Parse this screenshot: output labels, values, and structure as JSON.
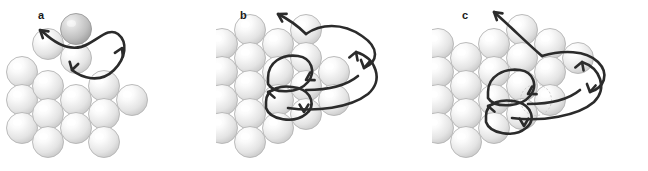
{
  "figure": {
    "width": 648,
    "height": 171,
    "background_color": "#ffffff",
    "caption_labels": [
      "a",
      "b",
      "c"
    ]
  },
  "style": {
    "sphere_fill_light": "#fbfbfb",
    "sphere_fill_mid": "#e4e4e4",
    "sphere_fill_edge": "#c9c9c9",
    "sphere_stroke": "#b4b4b4",
    "sphere_highlight": "#ffffff",
    "adatom_fill_light": "#e0e0e0",
    "adatom_fill_mid": "#bfbfbf",
    "adatom_fill_edge": "#9e9e9e",
    "adatom_stroke": "#9a9a9a",
    "arrow_color": "#2b2b2b",
    "arrow_width": 2.6,
    "label_color": "#1a1a1a",
    "sphere_radius": 15.5
  },
  "panels": [
    {
      "id": "a",
      "label": "a",
      "label_x": 38,
      "label_y": 10,
      "description": "Adatom hop across surface with exchange loop",
      "lattice_atoms": [
        {
          "cx": 22,
          "cy": 72,
          "r": 15.5,
          "type": "substrate"
        },
        {
          "cx": 22,
          "cy": 100,
          "r": 15.5,
          "type": "substrate"
        },
        {
          "cx": 22,
          "cy": 128,
          "r": 15.5,
          "type": "substrate"
        },
        {
          "cx": 48,
          "cy": 44,
          "r": 15.5,
          "type": "substrate"
        },
        {
          "cx": 48,
          "cy": 86,
          "r": 15.5,
          "type": "substrate"
        },
        {
          "cx": 48,
          "cy": 114,
          "r": 15.5,
          "type": "substrate"
        },
        {
          "cx": 48,
          "cy": 142,
          "r": 15.5,
          "type": "substrate"
        },
        {
          "cx": 76,
          "cy": 58,
          "r": 15.5,
          "type": "substrate"
        },
        {
          "cx": 76,
          "cy": 100,
          "r": 15.5,
          "type": "substrate"
        },
        {
          "cx": 76,
          "cy": 128,
          "r": 15.5,
          "type": "substrate"
        },
        {
          "cx": 104,
          "cy": 86,
          "r": 15.5,
          "type": "substrate"
        },
        {
          "cx": 104,
          "cy": 114,
          "r": 15.5,
          "type": "substrate"
        },
        {
          "cx": 104,
          "cy": 142,
          "r": 15.5,
          "type": "substrate"
        },
        {
          "cx": 132,
          "cy": 100,
          "r": 15.5,
          "type": "substrate"
        }
      ],
      "adatoms": [
        {
          "cx": 76,
          "cy": 29,
          "r": 15.5,
          "type": "adatom"
        }
      ],
      "arrows": [
        {
          "name": "exchange-loop-path",
          "d": "M 43 32 C 58 46, 74 52, 88 44 C 102 36, 110 28, 118 34 C 128 42, 126 58, 114 70 C 100 84, 82 78, 72 70"
        },
        {
          "name": "hop-arrow-up-left",
          "d": "M 43 32 L 40 30"
        }
      ],
      "arrowheads": [
        {
          "name": "arrowhead-up-left",
          "x": 40,
          "y": 30,
          "angle": -140
        },
        {
          "name": "arrowhead-down",
          "x": 72,
          "y": 70,
          "angle": 105
        },
        {
          "name": "arrowhead-right-up",
          "x": 122,
          "y": 48,
          "angle": -65
        }
      ]
    },
    {
      "id": "b",
      "label": "b",
      "label_x": 24,
      "label_y": 10,
      "description": "Adatom detachment from step edge with multiple exchange pathways",
      "lattice_atoms": [
        {
          "cx": 6,
          "cy": 44,
          "r": 15.5,
          "type": "substrate"
        },
        {
          "cx": 6,
          "cy": 72,
          "r": 15.5,
          "type": "substrate"
        },
        {
          "cx": 6,
          "cy": 100,
          "r": 15.5,
          "type": "substrate"
        },
        {
          "cx": 6,
          "cy": 128,
          "r": 15.5,
          "type": "substrate"
        },
        {
          "cx": 34,
          "cy": 30,
          "r": 15.5,
          "type": "substrate"
        },
        {
          "cx": 34,
          "cy": 58,
          "r": 15.5,
          "type": "substrate"
        },
        {
          "cx": 34,
          "cy": 86,
          "r": 15.5,
          "type": "substrate"
        },
        {
          "cx": 34,
          "cy": 114,
          "r": 15.5,
          "type": "substrate"
        },
        {
          "cx": 34,
          "cy": 142,
          "r": 15.5,
          "type": "substrate"
        },
        {
          "cx": 62,
          "cy": 44,
          "r": 15.5,
          "type": "substrate"
        },
        {
          "cx": 62,
          "cy": 72,
          "r": 15.5,
          "type": "substrate"
        },
        {
          "cx": 62,
          "cy": 100,
          "r": 15.5,
          "type": "substrate"
        },
        {
          "cx": 62,
          "cy": 128,
          "r": 15.5,
          "type": "substrate"
        },
        {
          "cx": 90,
          "cy": 30,
          "r": 15.5,
          "type": "substrate"
        },
        {
          "cx": 90,
          "cy": 58,
          "r": 15.5,
          "type": "substrate"
        },
        {
          "cx": 90,
          "cy": 86,
          "r": 15.5,
          "type": "substrate"
        },
        {
          "cx": 90,
          "cy": 114,
          "r": 15.5,
          "type": "substrate"
        },
        {
          "cx": 118,
          "cy": 72,
          "r": 15.5,
          "type": "substrate"
        },
        {
          "cx": 118,
          "cy": 100,
          "r": 15.5,
          "type": "substrate"
        }
      ],
      "adatoms": [],
      "arrows": [
        {
          "name": "detach-arrow-up-left",
          "d": "M 90 34 C 82 26, 74 20, 62 14"
        },
        {
          "name": "long-exchange-arc-upper",
          "d": "M 90 34 C 104 24, 126 22, 146 36 C 164 48, 162 62, 148 68"
        },
        {
          "name": "long-exchange-arc-lower",
          "d": "M 72 108 C 100 112, 134 108, 152 94 C 168 80, 160 58, 140 52"
        },
        {
          "name": "exchange-loop-upper",
          "d": "M 52 78 C 52 62, 66 54, 82 56 C 96 58, 100 72, 92 82 C 82 94, 58 94, 52 84 Z"
        },
        {
          "name": "exchange-loop-lower",
          "d": "M 50 102 C 50 88, 66 84, 82 88 C 96 92, 100 106, 90 114 C 78 124, 54 120, 50 108 Z"
        },
        {
          "name": "mid-return-arc",
          "d": "M 90 90 C 110 90, 130 86, 142 76"
        }
      ],
      "arrowheads": [
        {
          "name": "arrowhead-detach-up-left",
          "x": 62,
          "y": 14,
          "angle": -150
        },
        {
          "name": "arrowhead-upper-arc-in",
          "x": 148,
          "y": 68,
          "angle": 100
        },
        {
          "name": "arrowhead-lower-arc-in",
          "x": 140,
          "y": 52,
          "angle": -70
        },
        {
          "name": "arrowhead-loop-upper",
          "x": 90,
          "y": 80,
          "angle": 150
        },
        {
          "name": "arrowhead-loop-lower",
          "x": 88,
          "y": 112,
          "angle": 90
        },
        {
          "name": "arrowhead-loop-left",
          "x": 52,
          "y": 92,
          "angle": 190
        }
      ]
    },
    {
      "id": "c",
      "label": "c",
      "label_x": 30,
      "label_y": 10,
      "description": "Adatom ascent over step edge with exchange loops at the terrace",
      "lattice_atoms": [
        {
          "cx": 6,
          "cy": 44,
          "r": 15.5,
          "type": "substrate"
        },
        {
          "cx": 6,
          "cy": 72,
          "r": 15.5,
          "type": "substrate"
        },
        {
          "cx": 6,
          "cy": 100,
          "r": 15.5,
          "type": "substrate"
        },
        {
          "cx": 6,
          "cy": 128,
          "r": 15.5,
          "type": "substrate"
        },
        {
          "cx": 34,
          "cy": 58,
          "r": 15.5,
          "type": "substrate"
        },
        {
          "cx": 34,
          "cy": 86,
          "r": 15.5,
          "type": "substrate"
        },
        {
          "cx": 34,
          "cy": 114,
          "r": 15.5,
          "type": "substrate"
        },
        {
          "cx": 34,
          "cy": 142,
          "r": 15.5,
          "type": "substrate"
        },
        {
          "cx": 62,
          "cy": 44,
          "r": 15.5,
          "type": "substrate"
        },
        {
          "cx": 62,
          "cy": 72,
          "r": 15.5,
          "type": "substrate"
        },
        {
          "cx": 62,
          "cy": 100,
          "r": 15.5,
          "type": "substrate"
        },
        {
          "cx": 62,
          "cy": 128,
          "r": 15.5,
          "type": "substrate"
        },
        {
          "cx": 90,
          "cy": 30,
          "r": 15.5,
          "type": "substrate"
        },
        {
          "cx": 90,
          "cy": 58,
          "r": 15.5,
          "type": "substrate"
        },
        {
          "cx": 90,
          "cy": 86,
          "r": 15.5,
          "type": "substrate"
        },
        {
          "cx": 90,
          "cy": 114,
          "r": 15.5,
          "type": "substrate"
        },
        {
          "cx": 118,
          "cy": 44,
          "r": 15.5,
          "type": "substrate"
        },
        {
          "cx": 118,
          "cy": 72,
          "r": 15.5,
          "type": "substrate"
        },
        {
          "cx": 118,
          "cy": 100,
          "r": 15.5,
          "type": "substrate"
        },
        {
          "cx": 146,
          "cy": 58,
          "r": 15.5,
          "type": "substrate"
        }
      ],
      "adatoms": [],
      "adatom_ghosts": [
        {
          "cx": 104,
          "cy": 100,
          "r": 15.5
        }
      ],
      "arrows": [
        {
          "name": "ascent-arrow-up-left",
          "d": "M 110 56 C 96 44, 80 28, 62 12"
        },
        {
          "name": "long-exchange-arc-upper",
          "d": "M 110 56 C 130 50, 154 50, 166 62 C 178 74, 172 88, 158 92"
        },
        {
          "name": "long-exchange-arc-lower",
          "d": "M 80 118 C 110 122, 146 116, 162 102 C 176 88, 168 68, 150 62"
        },
        {
          "name": "exchange-loop-upper",
          "d": "M 56 92 C 56 76, 72 68, 88 70 C 102 72, 106 86, 98 96 C 88 108, 62 108, 56 98 Z"
        },
        {
          "name": "exchange-loop-lower",
          "d": "M 54 116 C 54 102, 70 98, 86 102 C 100 106, 104 120, 94 128 C 82 138, 58 134, 54 122 Z"
        },
        {
          "name": "mid-return-arc",
          "d": "M 96 104 C 116 104, 136 100, 148 90"
        }
      ],
      "arrowheads": [
        {
          "name": "arrowhead-ascent-up-left",
          "x": 62,
          "y": 12,
          "angle": -140
        },
        {
          "name": "arrowhead-upper-arc-in",
          "x": 158,
          "y": 92,
          "angle": 100
        },
        {
          "name": "arrowhead-lower-arc-in",
          "x": 150,
          "y": 62,
          "angle": -70
        },
        {
          "name": "arrowhead-loop-upper",
          "x": 96,
          "y": 94,
          "angle": 150
        },
        {
          "name": "arrowhead-loop-lower",
          "x": 92,
          "y": 126,
          "angle": 90
        },
        {
          "name": "arrowhead-loop-left",
          "x": 56,
          "y": 106,
          "angle": 190
        }
      ]
    }
  ]
}
